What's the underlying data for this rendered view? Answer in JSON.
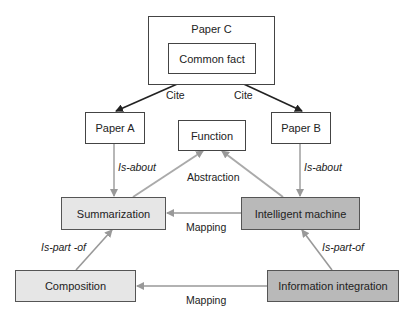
{
  "nodes": {
    "paper_c": "Paper C",
    "common_fact": "Common fact",
    "paper_a": "Paper A",
    "paper_b": "Paper B",
    "function": "Function",
    "summarization": "Summarization",
    "intelligent_machine": "Intelligent machine",
    "composition": "Composition",
    "information_integration": "Information integration"
  },
  "edges": {
    "cite_left": "Cite",
    "cite_right": "Cite",
    "is_about_left": "Is-about",
    "is_about_right": "Is-about",
    "abstraction": "Abstraction",
    "mapping_top": "Mapping",
    "mapping_bottom": "Mapping",
    "is_part_of_left": "Is-part -of",
    "is_part_of_right": "Is-part-of"
  },
  "colors": {
    "light_fill": "#e6e6e6",
    "dark_fill": "#b9b9b9",
    "black_edge": "#222222",
    "gray_edge": "#999999"
  }
}
